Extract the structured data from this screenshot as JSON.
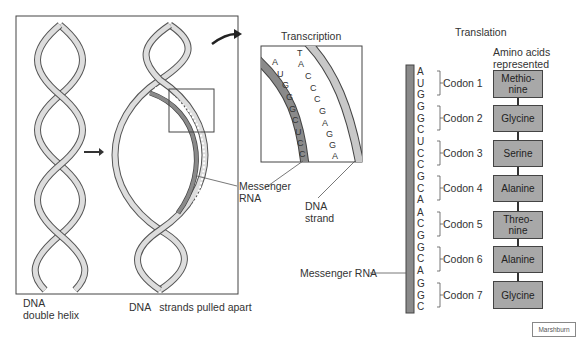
{
  "panels": {
    "left_label_line1": "DNA",
    "left_label_line2": "double helix",
    "middle_label": "DNA   strands pulled apart",
    "messenger_rna_label_line1": "Messenger",
    "messenger_rna_label_line2": "RNA"
  },
  "transcription": {
    "title": "Transcription",
    "rna_bases": [
      "A",
      "U",
      "G",
      "G",
      "G",
      "C",
      "U",
      "C",
      "C"
    ],
    "dna_bases": [
      "T",
      "A",
      "C",
      "C",
      "C",
      "G",
      "A",
      "G",
      "G",
      "A"
    ],
    "dna_strand_label_line1": "DNA",
    "dna_strand_label_line2": "strand"
  },
  "translation": {
    "title": "Translation",
    "amino_header_line1": "Amino acids",
    "amino_header_line2": "represented",
    "mrna_label": "Messenger RNA",
    "codons": [
      {
        "label": "Codon 1",
        "bases": [
          "A",
          "U",
          "G"
        ],
        "amino": [
          "Methio-",
          "nine"
        ]
      },
      {
        "label": "Codon 2",
        "bases": [
          "G",
          "G",
          "C"
        ],
        "amino": [
          "Glycine"
        ]
      },
      {
        "label": "Codon 3",
        "bases": [
          "U",
          "C",
          "C"
        ],
        "amino": [
          "Serine"
        ]
      },
      {
        "label": "Codon 4",
        "bases": [
          "G",
          "C",
          "A"
        ],
        "amino": [
          "Alanine"
        ]
      },
      {
        "label": "Codon 5",
        "bases": [
          "A",
          "C",
          "G"
        ],
        "amino": [
          "Threo-",
          "nine"
        ]
      },
      {
        "label": "Codon 6",
        "bases": [
          "G",
          "C",
          "A"
        ],
        "amino": [
          "Alanine"
        ]
      },
      {
        "label": "Codon 7",
        "bases": [
          "G",
          "G",
          "C"
        ],
        "amino": [
          "Glycine"
        ]
      }
    ]
  },
  "credit": "Marshburn",
  "colors": {
    "strand_fill": "#c8c8c8",
    "rna_fill": "#8a8a8a",
    "box_fill": "#a8a8a8",
    "outline": "#444444"
  }
}
